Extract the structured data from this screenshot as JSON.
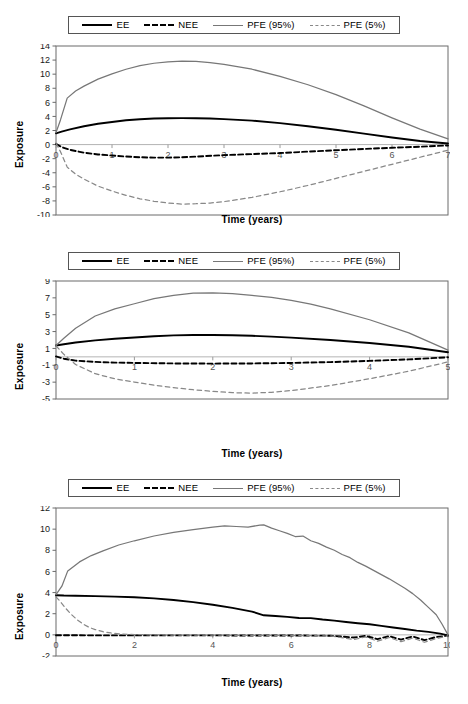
{
  "figure": {
    "panel_count": 3,
    "axis_label_y": "Exposure",
    "axis_label_x": "Time (years)"
  },
  "legend": {
    "entries": [
      {
        "label": "EE",
        "style": "solid",
        "color": "#000000",
        "key": "ee"
      },
      {
        "label": "NEE",
        "style": "dashed",
        "color": "#000000",
        "key": "nee"
      },
      {
        "label": "PFE (95%)",
        "style": "solid",
        "color": "#777777",
        "key": "pfe95"
      },
      {
        "label": "PFE (5%)",
        "style": "dashed",
        "color": "#888888",
        "key": "pfe5"
      }
    ]
  },
  "chart_data": [
    {
      "type": "line",
      "title": "",
      "xlabel": "Time (years)",
      "ylabel": "Exposure",
      "xlim": [
        0,
        7
      ],
      "ylim": [
        -10,
        14
      ],
      "xticks": [
        0,
        1,
        2,
        3,
        4,
        5,
        6,
        7
      ],
      "yticks": [
        -10,
        -8,
        -6,
        -4,
        -2,
        0,
        2,
        4,
        6,
        8,
        10,
        12,
        14
      ],
      "grid": false,
      "legend_position": "top",
      "series": [
        {
          "name": "EE",
          "color": "#000000",
          "style": "solid",
          "x": [
            0,
            0.1,
            0.25,
            0.5,
            0.75,
            1,
            1.25,
            1.5,
            1.75,
            2,
            2.25,
            2.5,
            2.75,
            3,
            3.5,
            4,
            4.5,
            5,
            5.5,
            6,
            6.5,
            7
          ],
          "y": [
            1.6,
            1.85,
            2.15,
            2.6,
            2.95,
            3.2,
            3.45,
            3.6,
            3.7,
            3.75,
            3.76,
            3.74,
            3.7,
            3.62,
            3.4,
            3.05,
            2.6,
            2.1,
            1.55,
            1.0,
            0.5,
            0.15
          ]
        },
        {
          "name": "NEE",
          "color": "#000000",
          "style": "dashed",
          "x": [
            0,
            0.1,
            0.25,
            0.5,
            0.75,
            1,
            1.25,
            1.5,
            1.75,
            2,
            2.25,
            2.5,
            3,
            3.5,
            4,
            4.5,
            5,
            5.5,
            6,
            6.5,
            7
          ],
          "y": [
            0.1,
            -0.35,
            -0.75,
            -1.15,
            -1.4,
            -1.55,
            -1.7,
            -1.8,
            -1.85,
            -1.85,
            -1.8,
            -1.7,
            -1.5,
            -1.35,
            -1.2,
            -1.0,
            -0.8,
            -0.62,
            -0.45,
            -0.3,
            -0.12
          ]
        },
        {
          "name": "PFE (95%)",
          "color": "#777777",
          "style": "solid",
          "x": [
            0,
            0.08,
            0.2,
            0.35,
            0.5,
            0.75,
            1,
            1.25,
            1.5,
            1.75,
            2,
            2.25,
            2.5,
            2.75,
            3,
            3.5,
            4,
            4.5,
            5,
            5.5,
            6,
            6.5,
            7
          ],
          "y": [
            1.7,
            3.5,
            6.6,
            7.6,
            8.3,
            9.3,
            10.05,
            10.7,
            11.2,
            11.55,
            11.75,
            11.85,
            11.8,
            11.65,
            11.4,
            10.7,
            9.7,
            8.5,
            7.1,
            5.5,
            3.8,
            2.2,
            0.8
          ]
        },
        {
          "name": "PFE (5%)",
          "color": "#888888",
          "style": "dashed",
          "x": [
            0,
            0.08,
            0.2,
            0.35,
            0.5,
            0.75,
            1,
            1.25,
            1.5,
            1.75,
            2,
            2.25,
            2.5,
            2.75,
            3,
            3.5,
            4,
            4.5,
            5,
            5.5,
            6,
            6.5,
            7
          ],
          "y": [
            0.2,
            -1.0,
            -3.2,
            -4.2,
            -4.9,
            -5.9,
            -6.6,
            -7.2,
            -7.7,
            -8.05,
            -8.3,
            -8.45,
            -8.4,
            -8.3,
            -8.1,
            -7.5,
            -6.7,
            -5.8,
            -4.8,
            -3.8,
            -2.8,
            -1.8,
            -0.8
          ]
        }
      ]
    },
    {
      "type": "line",
      "title": "",
      "xlabel": "Time (years)",
      "ylabel": "Exposure",
      "xlim": [
        0,
        5
      ],
      "ylim": [
        -5,
        9
      ],
      "xticks": [
        0,
        1,
        2,
        3,
        4,
        5
      ],
      "yticks": [
        -5,
        -3,
        -1,
        1,
        3,
        5,
        7,
        9
      ],
      "grid": false,
      "legend_position": "top",
      "series": [
        {
          "name": "EE",
          "color": "#000000",
          "style": "solid",
          "x": [
            0,
            0.1,
            0.25,
            0.5,
            0.75,
            1,
            1.25,
            1.5,
            1.75,
            2,
            2.25,
            2.5,
            2.75,
            3,
            3.5,
            4,
            4.5,
            5
          ],
          "y": [
            1.35,
            1.5,
            1.7,
            1.95,
            2.15,
            2.3,
            2.45,
            2.55,
            2.6,
            2.6,
            2.57,
            2.5,
            2.4,
            2.28,
            2.0,
            1.65,
            1.2,
            0.55
          ]
        },
        {
          "name": "NEE",
          "color": "#000000",
          "style": "dashed",
          "x": [
            0,
            0.1,
            0.25,
            0.5,
            0.75,
            1,
            1.5,
            2,
            2.5,
            3,
            3.5,
            4,
            4.5,
            5
          ],
          "y": [
            0.05,
            -0.22,
            -0.45,
            -0.6,
            -0.68,
            -0.72,
            -0.78,
            -0.8,
            -0.78,
            -0.72,
            -0.62,
            -0.48,
            -0.3,
            -0.05
          ]
        },
        {
          "name": "PFE (95%)",
          "color": "#777777",
          "style": "solid",
          "x": [
            0,
            0.1,
            0.25,
            0.5,
            0.75,
            1,
            1.25,
            1.5,
            1.75,
            2,
            2.25,
            2.5,
            2.75,
            3,
            3.25,
            3.5,
            4,
            4.5,
            5
          ],
          "y": [
            1.35,
            2.2,
            3.4,
            4.85,
            5.7,
            6.3,
            6.9,
            7.3,
            7.55,
            7.6,
            7.5,
            7.3,
            7.05,
            6.7,
            6.25,
            5.7,
            4.4,
            2.85,
            0.8
          ]
        },
        {
          "name": "PFE (5%)",
          "color": "#888888",
          "style": "dashed",
          "x": [
            0,
            0.1,
            0.25,
            0.5,
            0.75,
            1,
            1.25,
            1.5,
            1.75,
            2,
            2.25,
            2.5,
            2.75,
            3,
            3.5,
            4,
            4.5,
            5
          ],
          "y": [
            1.3,
            0.3,
            -0.9,
            -2.0,
            -2.6,
            -3.0,
            -3.35,
            -3.65,
            -3.9,
            -4.1,
            -4.25,
            -4.3,
            -4.2,
            -4.0,
            -3.4,
            -2.6,
            -1.7,
            -0.6
          ]
        }
      ]
    },
    {
      "type": "line",
      "title": "",
      "xlabel": "Time (years)",
      "ylabel": "Exposure",
      "xlim": [
        0,
        10
      ],
      "ylim": [
        -2,
        12
      ],
      "xticks": [
        0,
        2,
        4,
        6,
        8,
        10
      ],
      "yticks": [
        -2,
        0,
        2,
        4,
        6,
        8,
        10,
        12
      ],
      "grid": false,
      "legend_position": "top",
      "series": [
        {
          "name": "EE",
          "color": "#000000",
          "style": "solid",
          "x": [
            0,
            0.2,
            0.5,
            1,
            1.5,
            2,
            2.5,
            3,
            3.5,
            4,
            4.5,
            5,
            5.3,
            5.6,
            5.9,
            6.2,
            6.5,
            6.8,
            7.1,
            7.4,
            7.7,
            8,
            8.3,
            8.6,
            8.9,
            9.2,
            9.5,
            9.8,
            10
          ],
          "y": [
            3.75,
            3.72,
            3.7,
            3.66,
            3.62,
            3.56,
            3.45,
            3.3,
            3.1,
            2.85,
            2.55,
            2.2,
            1.85,
            1.78,
            1.7,
            1.6,
            1.58,
            1.45,
            1.35,
            1.22,
            1.1,
            1.0,
            0.85,
            0.7,
            0.55,
            0.4,
            0.28,
            0.12,
            -0.05
          ]
        },
        {
          "name": "NEE",
          "color": "#000000",
          "style": "dashed",
          "x": [
            0,
            0.5,
            1,
            2,
            3,
            4,
            5,
            6,
            7,
            7.6,
            7.9,
            8.2,
            8.5,
            8.8,
            9.1,
            9.4,
            9.7,
            10
          ],
          "y": [
            -0.04,
            -0.04,
            -0.05,
            -0.05,
            -0.05,
            -0.05,
            -0.06,
            -0.06,
            -0.08,
            -0.25,
            -0.1,
            -0.4,
            -0.12,
            -0.45,
            -0.15,
            -0.5,
            -0.2,
            -0.08
          ]
        },
        {
          "name": "PFE (95%)",
          "color": "#777777",
          "style": "solid",
          "x": [
            0,
            0.15,
            0.3,
            0.6,
            0.9,
            1.2,
            1.6,
            2,
            2.5,
            3,
            3.5,
            4,
            4.3,
            4.6,
            4.9,
            5.2,
            5.3,
            5.5,
            5.7,
            5.9,
            6.1,
            6.3,
            6.5,
            6.7,
            6.9,
            7.1,
            7.3,
            7.5,
            7.7,
            7.9,
            8.1,
            8.3,
            8.5,
            8.7,
            8.9,
            9.1,
            9.3,
            9.5,
            9.7,
            9.85,
            10
          ],
          "y": [
            3.8,
            4.6,
            6.05,
            6.9,
            7.5,
            7.95,
            8.5,
            8.9,
            9.35,
            9.7,
            9.95,
            10.2,
            10.3,
            10.25,
            10.2,
            10.38,
            10.4,
            10.1,
            9.85,
            9.6,
            9.3,
            9.35,
            8.9,
            8.65,
            8.3,
            8.0,
            7.6,
            7.3,
            6.85,
            6.5,
            6.1,
            5.7,
            5.3,
            4.85,
            4.4,
            3.9,
            3.3,
            2.6,
            1.9,
            1.0,
            0.0
          ]
        },
        {
          "name": "PFE (5%)",
          "color": "#888888",
          "style": "dashed",
          "x": [
            0,
            0.1,
            0.25,
            0.4,
            0.55,
            0.7,
            0.85,
            1,
            1.2,
            1.4,
            1.7,
            2,
            3,
            4,
            5,
            6,
            7,
            7.6,
            7.9,
            8.2,
            8.5,
            8.8,
            9.1,
            9.4,
            9.7,
            10
          ],
          "y": [
            3.6,
            3.2,
            2.5,
            1.9,
            1.4,
            1.0,
            0.7,
            0.5,
            0.3,
            0.18,
            0.07,
            0.02,
            -0.02,
            -0.03,
            -0.05,
            -0.06,
            -0.1,
            -0.45,
            -0.2,
            -0.6,
            -0.25,
            -0.65,
            -0.3,
            -0.7,
            -0.35,
            -0.1
          ]
        }
      ]
    }
  ]
}
